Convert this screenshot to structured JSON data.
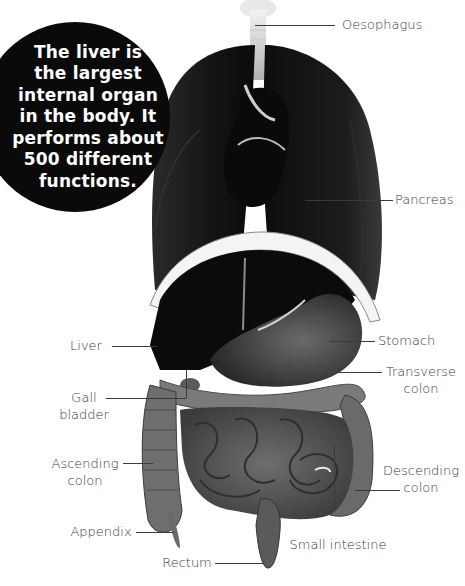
{
  "callout": {
    "text": "The liver is\nthe largest\ninternal organ\nin the body. It\nperforms about\n500 different\nfunctions."
  },
  "labels": {
    "oesophagus": "Oesophagus",
    "pancreas": "Pancreas",
    "stomach": "Stomach",
    "transverse_colon": "Transverse\ncolon",
    "descending_colon": "Descending\ncolon",
    "small_intestine": "Small intestine",
    "liver": "Liver",
    "gall_bladder": "Gall\nbladder",
    "ascending_colon": "Ascending\ncolon",
    "appendix": "Appendix",
    "rectum": "Rectum"
  },
  "colors": {
    "background": "#ffffff",
    "callout_bg": "#0a0a0a",
    "callout_text": "#ffffff",
    "label_text": "#3a3a3a",
    "organ_dark": "#111111",
    "organ_mid": "#5a5a5a",
    "organ_light": "#9a9a9a"
  }
}
